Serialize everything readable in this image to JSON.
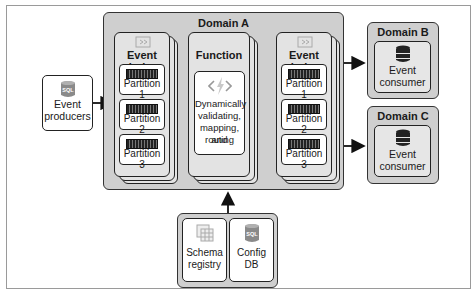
{
  "producer": {
    "icon": "sql-database-icon",
    "icon_text": "SQL",
    "label_line1": "Event",
    "label_line2": "producers"
  },
  "domain_a": {
    "title": "Domain A",
    "event_hubs_in": {
      "title": "Event hubs",
      "icon": "event-hubs-icon",
      "partitions": [
        "Partition 1",
        "Partition 2",
        "Partition 3"
      ]
    },
    "function": {
      "title": "Function",
      "icon": "code-bolt-icon",
      "lines": [
        "Dynamically",
        "validating,",
        "mapping, and",
        "routing"
      ]
    },
    "event_hubs_out": {
      "title": "Event hubs",
      "icon": "event-hubs-icon",
      "partitions": [
        "Partition 1",
        "Partition 2",
        "Partition 3"
      ]
    }
  },
  "domain_b": {
    "title": "Domain B",
    "icon": "database-icon",
    "label_line1": "Event",
    "label_line2": "consumer"
  },
  "domain_c": {
    "title": "Domain C",
    "icon": "database-icon",
    "label_line1": "Event",
    "label_line2": "consumer"
  },
  "support": {
    "schema_registry": {
      "icon": "grid-table-icon",
      "label_line1": "Schema",
      "label_line2": "registry"
    },
    "config_db": {
      "icon": "sql-database-icon",
      "icon_text": "SQL",
      "label_line1": "Config",
      "label_line2": "DB"
    }
  },
  "colors": {
    "domain_fill": "#cfcfcf",
    "stack_fill": "#e3e3e3",
    "stroke": "#222222",
    "sql_icon": "#8a8a8a"
  }
}
